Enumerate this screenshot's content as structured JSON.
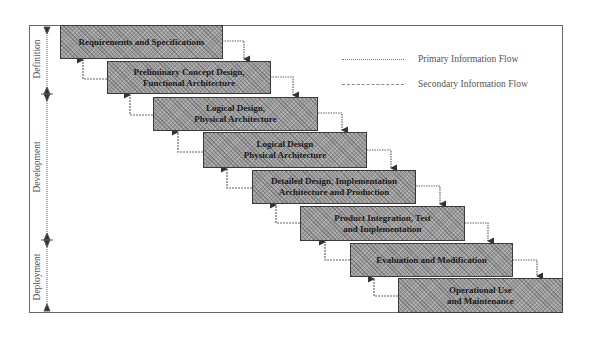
{
  "diagram": {
    "type": "waterfall-lifecycle",
    "legend": [
      {
        "id": "primary",
        "label": "Primary Information Flow",
        "style": "dotted"
      },
      {
        "id": "secondary",
        "label": "Secondary Information Flow",
        "style": "dashed"
      }
    ],
    "phases": [
      {
        "label": "Definition"
      },
      {
        "label": "Development"
      },
      {
        "label": "Deployment"
      }
    ],
    "stages": [
      {
        "label": "Requirements and Specifications"
      },
      {
        "label": "Preliminary Concept Design,\nFunctional Architecture"
      },
      {
        "label": "Logical Design,\nPhysical Architecture"
      },
      {
        "label": "Logical Design\nPhysical Architecture"
      },
      {
        "label": "Detailed Design, Implementation\nArchitecture and Production"
      },
      {
        "label": "Product Integration, Test\nand Implementation"
      },
      {
        "label": "Evaluation and Modification"
      },
      {
        "label": "Operational Use\nand Maintenance"
      }
    ],
    "colors": {
      "box_fill": "#9c9c9c",
      "box_border": "#3a3a3a",
      "line": "#6a6a6a",
      "text": "#1a1a1a"
    }
  }
}
